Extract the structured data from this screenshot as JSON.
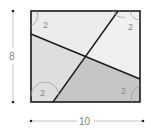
{
  "diagram": {
    "shape": "rectangle",
    "dimensions": {
      "height_label": "8",
      "width_label": "10"
    },
    "angle_labels": {
      "top_left": "2",
      "top_right": "2",
      "bottom_left": "2",
      "bottom_right": "2"
    },
    "colors": {
      "outline": "#1a1a1a",
      "region_light": "#eeeeee",
      "region_mid": "#dddddd",
      "region_dark": "#c4c4c4",
      "dimension_line": "#888888"
    }
  }
}
